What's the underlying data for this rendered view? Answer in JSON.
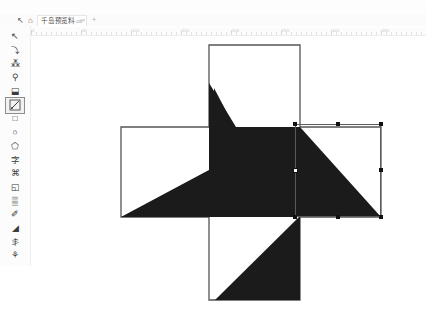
{
  "app": {
    "name": "vector-graphics-editor",
    "canvas_bg": "#ffffff",
    "shape_fill": "#1b1b1b",
    "outline_stroke": "#555555",
    "handle_color": "#111111"
  },
  "tabbar": {
    "cursor_icon": "arrow-cursor-icon",
    "cursor_glyph": "↖",
    "home_icon": "home-icon",
    "home_glyph": "⌂",
    "tab_label": "千岛预览料",
    "tab_ext": ".cdr",
    "close_glyph": "×",
    "new_tab_glyph": "+"
  },
  "ruler": {
    "labels": [
      "0",
      "50",
      "100",
      "150",
      "200",
      "250",
      "300",
      "350"
    ],
    "unit": "mm"
  },
  "toolbox": {
    "items": [
      {
        "name": "pick-tool",
        "glyph": "↖",
        "selected": false
      },
      {
        "name": "freehand-tool",
        "glyph": "⤵",
        "selected": false
      },
      {
        "name": "shape-edit-tool",
        "glyph": "⁂",
        "selected": false
      },
      {
        "name": "zoom-tool",
        "glyph": "⚲",
        "selected": false
      },
      {
        "name": "fill-bucket-tool",
        "glyph": "⬓",
        "selected": false
      },
      {
        "name": "gradient-fill-tool",
        "glyph": "",
        "selected": true
      },
      {
        "name": "rectangle-tool",
        "glyph": "□",
        "selected": false
      },
      {
        "name": "ellipse-tool",
        "glyph": "○",
        "selected": false
      },
      {
        "name": "polygon-tool",
        "glyph": "⬠",
        "selected": false
      },
      {
        "name": "text-tool",
        "glyph": "字",
        "selected": false
      },
      {
        "name": "crop-tool",
        "glyph": "⌘",
        "selected": false
      },
      {
        "name": "blend-tool",
        "glyph": "◱",
        "selected": false
      },
      {
        "name": "grid-table-tool",
        "glyph": "▒",
        "selected": false
      },
      {
        "name": "pen-tool",
        "glyph": "✐",
        "selected": false
      },
      {
        "name": "eyedropper-tool",
        "glyph": "◢",
        "selected": false
      },
      {
        "name": "dimension-tool",
        "glyph": "丯",
        "selected": false
      },
      {
        "name": "connector-tool",
        "glyph": "⚘",
        "selected": false
      }
    ]
  },
  "selection": {
    "label": "selected-object",
    "frame": {
      "x": 263,
      "y": 88,
      "w": 86,
      "h": 93
    },
    "handles": [
      {
        "name": "handle-top-left",
        "x": 263,
        "y": 88
      },
      {
        "name": "handle-top-center",
        "x": 306,
        "y": 88
      },
      {
        "name": "handle-top-right",
        "x": 349,
        "y": 88
      },
      {
        "name": "handle-middle-left",
        "x": 263,
        "y": 134
      },
      {
        "name": "handle-middle-right",
        "x": 349,
        "y": 134
      },
      {
        "name": "handle-bottom-left",
        "x": 263,
        "y": 181
      },
      {
        "name": "handle-bottom-center",
        "x": 306,
        "y": 181
      },
      {
        "name": "handle-bottom-right",
        "x": 349,
        "y": 181
      }
    ],
    "center_marker": {
      "name": "rotation-center-marker",
      "x": 263,
      "y": 134
    }
  },
  "artwork": {
    "cross_outline": {
      "name": "cross-shape-outline",
      "stroke": "#555555",
      "path": "M 177,9 L 268,9 L 268,91 L 349,91 L 349,181 L 268,181 L 268,264 L 177,264 L 177,181 L 89,181 L 89,91 L 177,91 Z"
    },
    "pinwheel": {
      "name": "pinwheel-dark-shape",
      "fill": "#1b1b1b",
      "path": "M 265,90 L 265,134 L 349,181 L 268,181 L 268,136 L 183,264 L 268,264 L 268,181 L 177,181 L 177,91 L 268,91 L 268,9"
    }
  }
}
